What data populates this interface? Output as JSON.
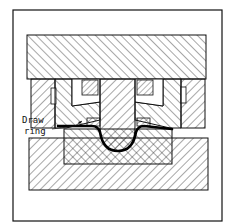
{
  "figure": {
    "type": "sectional-drawing",
    "labels": {
      "draw_ring_line1": "Draw",
      "draw_ring_line2": "ring"
    },
    "colors": {
      "line": "#111111",
      "background": "#ffffff",
      "workpiece": "#000000"
    }
  }
}
